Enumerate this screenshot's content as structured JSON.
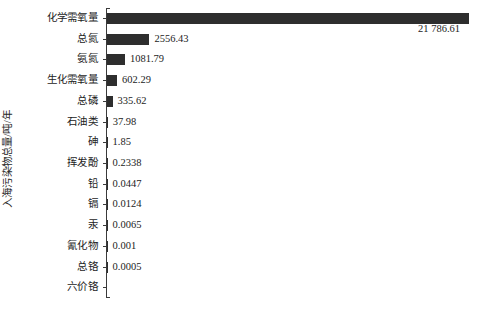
{
  "chart_data": {
    "type": "bar",
    "orientation": "horizontal",
    "title": "",
    "subtitle": "",
    "xlabel": "",
    "ylabel": "入海污染物总量/吨/年",
    "grid": false,
    "legend": null,
    "xlim": [
      0,
      23200
    ],
    "categories": [
      "化学需氧量",
      "总氮",
      "氨氮",
      "生化需氧量",
      "总磷",
      "石油类",
      "砷",
      "挥发酚",
      "铅",
      "镉",
      "汞",
      "氰化物",
      "总铬",
      "六价铬"
    ],
    "values": [
      21786.61,
      2556.43,
      1081.79,
      602.29,
      335.62,
      37.98,
      1.85,
      0.2338,
      0.0447,
      0.0124,
      0.0065,
      0.001,
      0.0005,
      null
    ],
    "value_labels": [
      "21 786.61",
      "2556.43",
      "1081.79",
      "602.29",
      "335.62",
      "37.98",
      "1.85",
      "0.2338",
      "0.0447",
      "0.0124",
      "0.0065",
      "0.001",
      "0.0005",
      ""
    ],
    "bar_color": "#2e2e2e",
    "axis_color": "#3a3a3a",
    "background_color": "#ffffff",
    "text_color": "#1c1c1c"
  }
}
